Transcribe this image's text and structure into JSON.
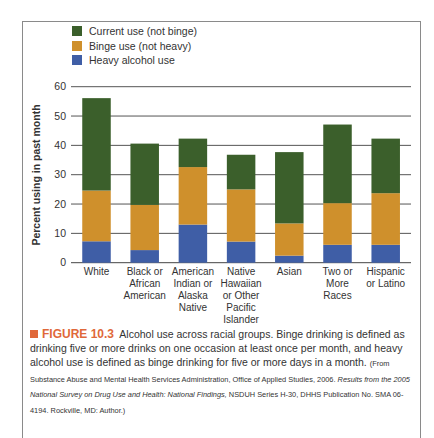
{
  "chart_data": {
    "type": "bar",
    "stacked": true,
    "title": "",
    "xlabel": "",
    "ylabel": "Percent using in past month",
    "ylim": [
      0,
      60
    ],
    "yticks": [
      0,
      10,
      20,
      30,
      40,
      50,
      60
    ],
    "grid": true,
    "legend_position": "top-left",
    "categories": [
      "White",
      "Black or\nAfrican\nAmerican",
      "American\nIndian or\nAlaska\nNative",
      "Native\nHawaiian\nor Other\nPacific\nIslander",
      "Asian",
      "Two or\nMore\nRaces",
      "Hispanic\nor Latino"
    ],
    "series": [
      {
        "name": "Heavy alcohol use",
        "color": "#3f5ea6",
        "values": [
          7.3,
          4.3,
          13.0,
          7.2,
          2.4,
          6.1,
          6.1
        ]
      },
      {
        "name": "Binge use (not heavy)",
        "color": "#cf902c",
        "values": [
          17.3,
          15.4,
          19.6,
          17.8,
          11.0,
          14.2,
          17.6
        ]
      },
      {
        "name": "Current use (not binge)",
        "color": "#3b5f2b",
        "values": [
          31.5,
          20.9,
          9.7,
          11.8,
          24.3,
          26.8,
          18.6
        ]
      }
    ],
    "totals": [
      56.1,
      40.6,
      42.3,
      36.8,
      37.7,
      47.1,
      42.3
    ]
  },
  "legend": [
    {
      "label": "Current use (not binge)",
      "color": "#3b5f2b"
    },
    {
      "label": "Binge use (not heavy)",
      "color": "#cf902c"
    },
    {
      "label": "Heavy alcohol use",
      "color": "#3f5ea6"
    }
  ],
  "caption": {
    "figure_label": "FIGURE 10.3",
    "figure_color": "#e0683a",
    "text": "Alcohol use across racial groups. Binge drinking is defined as drinking five or more drinks on one occasion at least once per month, and heavy alcohol use is defined as binge drinking for five or more days in a month.",
    "source_prefix": "(From Substance Abuse and Mental Health Services Administration, Office of Applied Studies, 2006. ",
    "source_title": "Results from the 2005 National Survey on Drug Use and Health: National Findings,",
    "source_suffix": " NSDUH Series H-30, DHHS Publication No. SMA 06-4194. Rockville, MD: Author.)"
  }
}
